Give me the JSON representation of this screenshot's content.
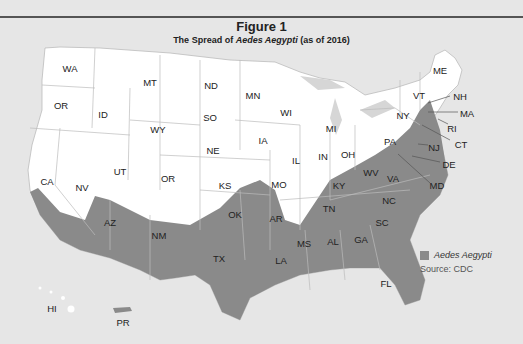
{
  "figure": {
    "title": "Figure 1",
    "subtitle_prefix": "The Spread of ",
    "subtitle_italic": "Aedes Aegypti",
    "subtitle_suffix": " (as of 2016)"
  },
  "colors": {
    "background": "#e6e6e6",
    "state_fill": "#ffffff",
    "aedes_fill": "#8a8a8a",
    "border": "#bbbbbb",
    "rule": "#555555"
  },
  "legend": {
    "series_label": "Aedes Aegypti",
    "source": "Source: CDC"
  },
  "states": {
    "WA": "WA",
    "OR": "OR",
    "ID": "ID",
    "MT": "MT",
    "WY": "WY",
    "ND": "ND",
    "SD": "SO",
    "NE": "NE",
    "CO": "OR",
    "KS": "KS",
    "MN": "MN",
    "WI": "WI",
    "MI": "MI",
    "IA": "IA",
    "IL": "IL",
    "IN": "IN",
    "OH": "OH",
    "MO": "MO",
    "NV": "NV",
    "UT": "UT",
    "CA": "CA",
    "AZ": "AZ",
    "NM": "NM",
    "TX": "TX",
    "OK": "OK",
    "AR": "AR",
    "LA": "LA",
    "MS": "MS",
    "AL": "AL",
    "GA": "GA",
    "FL": "FL",
    "SC": "SC",
    "NC": "NC",
    "TN": "TN",
    "KY": "KY",
    "WV": "WV",
    "VA": "VA",
    "PA": "PA",
    "NY": "NY",
    "VT": "VT",
    "ME": "ME",
    "NH": "NH",
    "MA": "MA",
    "RI": "RI",
    "CT": "CT",
    "NJ": "NJ",
    "DE": "DE",
    "MD": "MD",
    "HI": "HI",
    "PR": "PR"
  },
  "aedes_presence": [
    "CA",
    "AZ",
    "NM",
    "TX",
    "OK",
    "AR",
    "LA",
    "MS",
    "AL",
    "GA",
    "FL",
    "SC",
    "NC",
    "TN",
    "KY",
    "WV",
    "VA",
    "MD",
    "DE",
    "NJ",
    "PR"
  ]
}
